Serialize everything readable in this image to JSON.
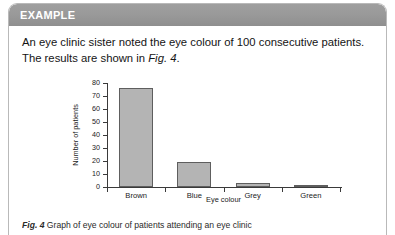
{
  "box": {
    "header_title": "EXAMPLE",
    "header_color": "#979797",
    "border_color": "#b9b9b9"
  },
  "intro": {
    "text_before": "An eye clinic sister noted the eye colour of 100 consecutive patients. The results are shown in ",
    "figure_reference": "Fig. 4",
    "text_after": "."
  },
  "caption": {
    "label": "Fig. 4",
    "text": "Graph of eye colour of patients attending an eye clinic"
  },
  "chart_data": {
    "type": "bar",
    "title": "",
    "categories": [
      "Brown",
      "Blue",
      "Grey",
      "Green"
    ],
    "values": [
      76,
      19,
      3,
      1
    ],
    "xlabel": "Eye colour",
    "ylabel": "Number of patients",
    "ylim": [
      0,
      80
    ],
    "yticks": [
      0,
      10,
      20,
      30,
      40,
      50,
      60,
      70,
      80
    ],
    "grid": false,
    "legend": "none",
    "bar_fill": "#b4b4b4",
    "bar_stroke": "#5e5e5e"
  }
}
